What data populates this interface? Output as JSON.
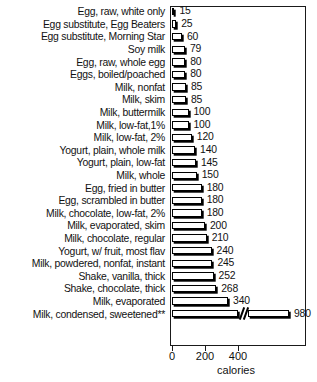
{
  "chart_data": {
    "type": "bar",
    "orientation": "horizontal",
    "title": "",
    "xlabel": "calories",
    "ylabel": "",
    "xlim": [
      0,
      400
    ],
    "xticks": [
      0,
      200,
      400
    ],
    "xticklabels": [
      "0",
      "200",
      "400"
    ],
    "grid": false,
    "legend": null,
    "axis_break": {
      "present": true,
      "note": "last bar exceeds axis; drawn with a break symbol then a continued segment"
    },
    "footnote_marker": "**",
    "categories": [
      "Egg, raw, white only",
      "Egg substitute, Egg Beaters",
      "Egg substitute, Morning Star",
      "Soy milk",
      "Egg, raw, whole egg",
      "Eggs, boiled/poached",
      "Milk, nonfat",
      "Milk, skim",
      "Milk, buttermilk",
      "Milk, low-fat,1%",
      "Milk, low-fat, 2%",
      "Yogurt, plain, whole milk",
      "Yogurt, plain, low-fat",
      "Milk, whole",
      "Egg, fried in butter",
      "Egg, scrambled in butter",
      "Milk, chocolate, low-fat, 2%",
      "Milk, evaporated, skim",
      "Milk, chocolate, regular",
      "Yogurt, w/ fruit, most flav",
      "Milk, powdered, nonfat, instant",
      "Shake, vanilla, thick",
      "Shake, chocolate, thick",
      "Milk, evaporated",
      "Milk, condensed, sweetened**"
    ],
    "values": [
      15,
      25,
      60,
      79,
      80,
      80,
      85,
      85,
      100,
      100,
      120,
      140,
      145,
      150,
      180,
      180,
      180,
      200,
      210,
      240,
      245,
      252,
      268,
      340,
      980
    ],
    "value_labels": [
      "15",
      "25",
      "60",
      "79",
      "80",
      "80",
      "85",
      "85",
      "100",
      "100",
      "120",
      "140",
      "145",
      "150",
      "180",
      "180",
      "180",
      "200",
      "210",
      "240",
      "245",
      "252",
      "268",
      "340",
      "980"
    ]
  },
  "style": {
    "bar_fill": "#ffffff",
    "bar_edge": "#000000",
    "bar_shadow": "#000000",
    "frame_color": "#1a1a1a",
    "text_color": "#111111",
    "background": "#ffffff"
  }
}
